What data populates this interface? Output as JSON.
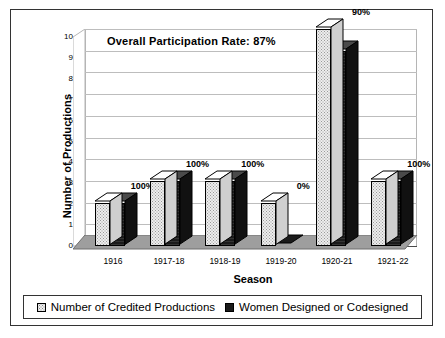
{
  "chart_data": {
    "type": "bar",
    "title": "",
    "annotation": "Overall Participation Rate:  87%",
    "xlabel": "Season",
    "ylabel": "Number of Productions",
    "categories": [
      "1916",
      "1917-18",
      "1918-19",
      "1919-20",
      "1920-21",
      "1921-22"
    ],
    "ylim": [
      0,
      10
    ],
    "yticks": [
      "0",
      "1",
      "2",
      "3",
      "4",
      "5",
      "6",
      "7",
      "8",
      "9",
      "10"
    ],
    "grid": true,
    "legend_position": "bottom",
    "series": [
      {
        "name": "Number of Credited Productions",
        "values": [
          2,
          3,
          3,
          2,
          10,
          3
        ],
        "color": "#ededed"
      },
      {
        "name": "Women Designed or Codesigned",
        "values": [
          2,
          3,
          3,
          0,
          9,
          3
        ],
        "color": "#1b1b1b"
      }
    ],
    "data_labels": [
      "100%",
      "100%",
      "100%",
      "0%",
      "90%",
      "100%"
    ]
  },
  "legend": {
    "items": [
      {
        "label": "Number of Credited Productions",
        "swatch": "light-dotted-square"
      },
      {
        "label": "Women Designed or Codesigned",
        "swatch": "dark-filled-square"
      }
    ]
  }
}
